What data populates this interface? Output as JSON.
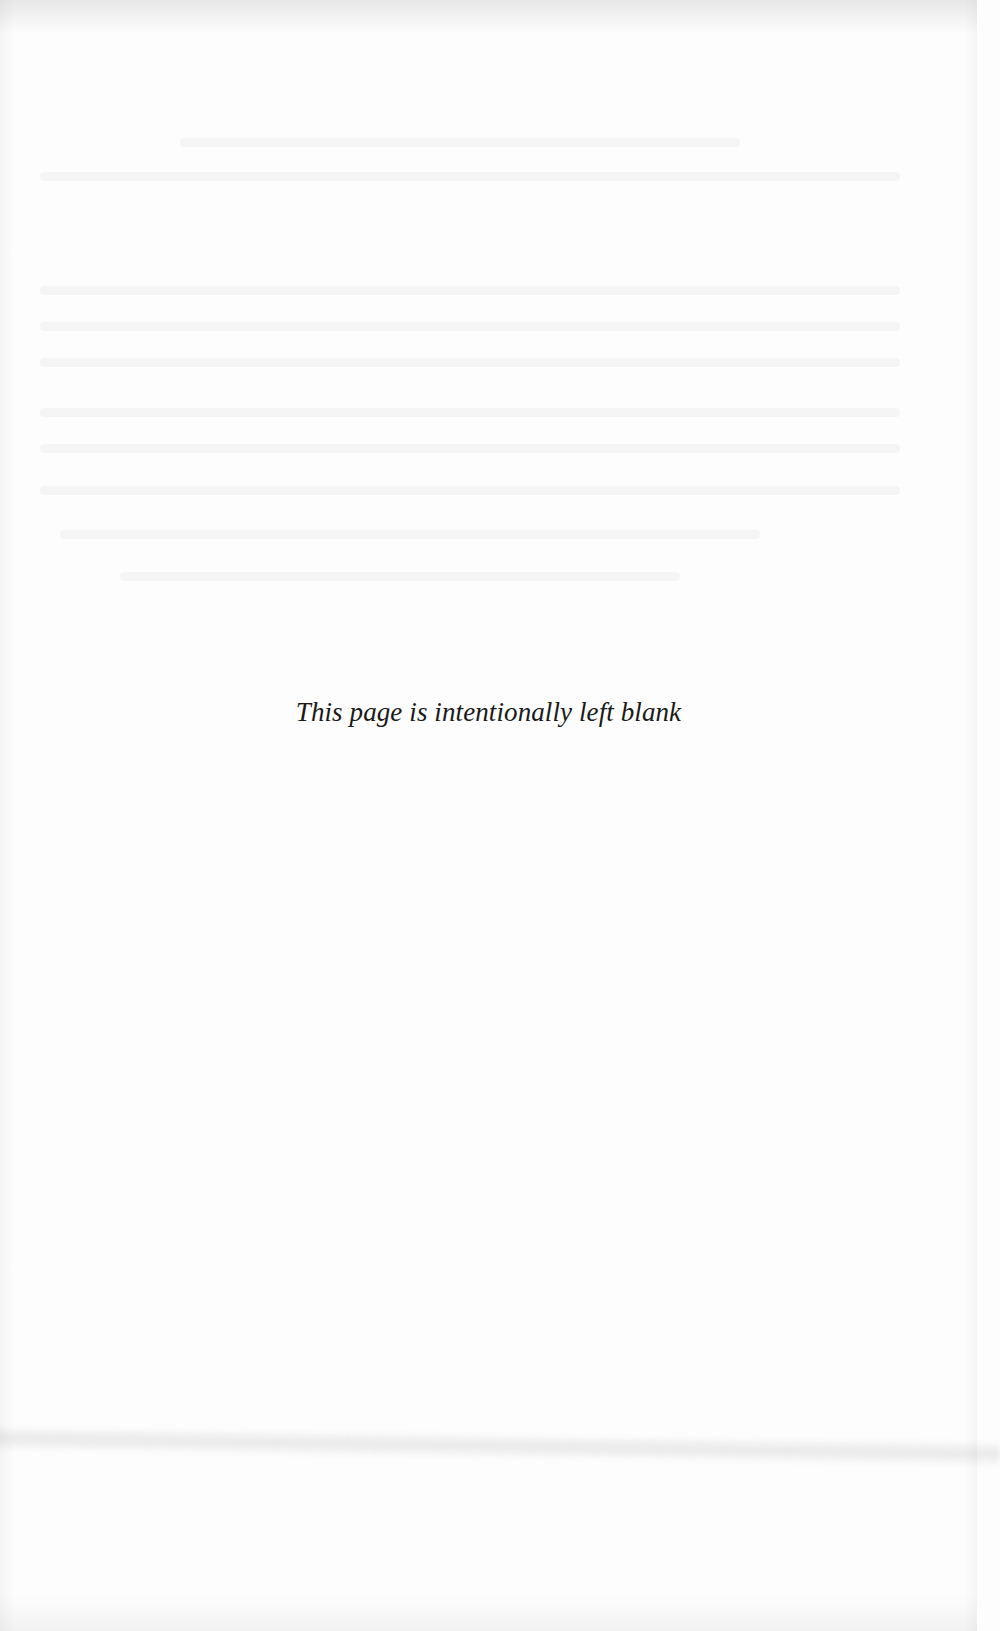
{
  "page": {
    "type": "scanned-book-page",
    "notice_text": "This page is intentionally left blank",
    "background_color": "#fdfdfd",
    "text_color": "#1a1a1a"
  }
}
